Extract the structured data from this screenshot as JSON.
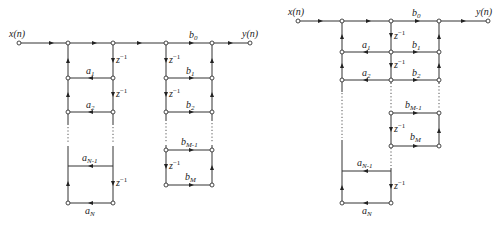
{
  "diagrams": [
    {
      "name": "direct-form-I",
      "input_label": "x(n)",
      "output_label": "y(n)",
      "feedback_coefficients": [
        "a",
        "1",
        "a",
        "2",
        "a",
        "N-1",
        "a",
        "N"
      ],
      "a_labels": [
        {
          "base": "a",
          "sub": "1"
        },
        {
          "base": "a",
          "sub": "2"
        },
        {
          "base": "a",
          "sub": "N-1"
        },
        {
          "base": "a",
          "sub": "N"
        }
      ],
      "b_labels": [
        {
          "base": "b",
          "sub": "0"
        },
        {
          "base": "b",
          "sub": "1"
        },
        {
          "base": "b",
          "sub": "2"
        },
        {
          "base": "b",
          "sub": "M-1"
        },
        {
          "base": "b",
          "sub": "M"
        }
      ],
      "delay_label": {
        "base": "z",
        "sup": "−1"
      }
    },
    {
      "name": "direct-form-II",
      "input_label": "x(n)",
      "output_label": "y(n)",
      "a_labels": [
        {
          "base": "a",
          "sub": "1"
        },
        {
          "base": "a",
          "sub": "2"
        },
        {
          "base": "a",
          "sub": "N-1"
        },
        {
          "base": "a",
          "sub": "N"
        }
      ],
      "b_labels": [
        {
          "base": "b",
          "sub": "0"
        },
        {
          "base": "b",
          "sub": "1"
        },
        {
          "base": "b",
          "sub": "2"
        },
        {
          "base": "b",
          "sub": "M-1"
        },
        {
          "base": "b",
          "sub": "M"
        }
      ],
      "delay_label": {
        "base": "z",
        "sup": "−1"
      }
    }
  ]
}
